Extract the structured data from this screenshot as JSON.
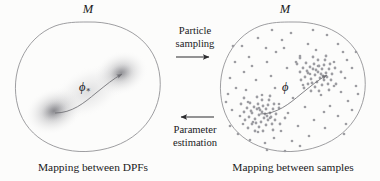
{
  "figure": {
    "background_color": "#fcfcfb",
    "outline_color": "#8c8c90",
    "density_color": "#9a9a9e",
    "sample_color": "#9d9da2",
    "curve_color": "#6e6e73",
    "arrow_color": "#2b2b2e"
  },
  "left_panel": {
    "manifold_label": "M",
    "caption": "Mapping between DPFs",
    "map_label": "ϕ",
    "map_label_subscript": "∗",
    "densities": [
      {
        "cx": 54,
        "cy": 111,
        "rx": 27,
        "ry": 21,
        "peak_opacity": 0.58
      },
      {
        "cx": 120,
        "cy": 73,
        "rx": 25,
        "ry": 20,
        "peak_opacity": 0.52
      }
    ],
    "outline": {
      "cx": 88,
      "cy": 86,
      "rx": 72,
      "ry": 64
    }
  },
  "right_panel": {
    "manifold_label": "M",
    "caption": "Mapping between samples",
    "map_label": "ϕ",
    "outline": {
      "cx": 293,
      "cy": 86,
      "rx": 72,
      "ry": 64
    },
    "clusters": [
      {
        "cx": 264,
        "cy": 112,
        "spread": 12,
        "count": 46
      },
      {
        "cx": 320,
        "cy": 72,
        "spread": 11,
        "count": 46
      }
    ],
    "background_samples": 78
  },
  "flows": [
    {
      "id": "particle-sampling",
      "line1": "Particle",
      "line2": "sampling",
      "direction": "right",
      "arrow_y": 57,
      "arrow_x1": 176,
      "arrow_x2": 214,
      "text_top": 25
    },
    {
      "id": "parameter-estimation",
      "line1": "Parameter",
      "line2": "estimation",
      "direction": "left",
      "arrow_y": 117,
      "arrow_x1": 176,
      "arrow_x2": 214,
      "text_top": 124
    }
  ]
}
